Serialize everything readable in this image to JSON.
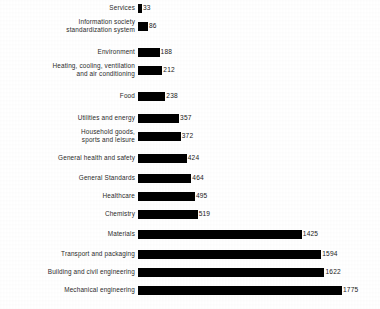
{
  "chart_data": {
    "type": "bar",
    "orientation": "horizontal",
    "title": "",
    "subtitle": "",
    "xlabel": "",
    "ylabel": "",
    "grid": false,
    "legend": null,
    "axis_visible": false,
    "value_labels": true,
    "xlim": [
      0,
      1775
    ],
    "bar_color": "#000000",
    "background_color": "#ffffff",
    "categories": [
      "Services",
      "Information society\nstandardization system",
      "Environment",
      "Heating, cooling, ventilation\nand air conditioning",
      "Food",
      "Utilities and energy",
      "Household goods,\nsports and leisure",
      "General health and safety",
      "General Standards",
      "Healthcare",
      "Chemistry",
      "Materials",
      "Transport and packaging",
      "Building and civil engineering",
      "Mechanical engineering"
    ],
    "values": [
      33,
      86,
      188,
      212,
      238,
      357,
      372,
      424,
      464,
      495,
      519,
      1425,
      1594,
      1622,
      1775
    ],
    "value_labels_text": [
      "33",
      "86",
      "188",
      "212",
      "238",
      "357",
      "372",
      "424",
      "464",
      "495",
      "519",
      "1425",
      "1594",
      "1622",
      "1775"
    ]
  },
  "rows": [
    {
      "label": "Services",
      "value": 33,
      "value_text": "33"
    },
    {
      "label": "Information society\nstandardization system",
      "value": 86,
      "value_text": "86"
    },
    {
      "label": "Environment",
      "value": 188,
      "value_text": "188"
    },
    {
      "label": "Heating, cooling, ventilation\nand air conditioning",
      "value": 212,
      "value_text": "212"
    },
    {
      "label": "Food",
      "value": 238,
      "value_text": "238"
    },
    {
      "label": "Utilities and energy",
      "value": 357,
      "value_text": "357"
    },
    {
      "label": "Household goods,\nsports and leisure",
      "value": 372,
      "value_text": "372"
    },
    {
      "label": "General health and safety",
      "value": 424,
      "value_text": "424"
    },
    {
      "label": "General Standards",
      "value": 464,
      "value_text": "464"
    },
    {
      "label": "Healthcare",
      "value": 495,
      "value_text": "495"
    },
    {
      "label": "Chemistry",
      "value": 519,
      "value_text": "519"
    },
    {
      "label": "Materials",
      "value": 1425,
      "value_text": "1425"
    },
    {
      "label": "Transport and packaging",
      "value": 1594,
      "value_text": "1594"
    },
    {
      "label": "Building and civil engineering",
      "value": 1622,
      "value_text": "1622"
    },
    {
      "label": "Mechanical engineering",
      "value": 1775,
      "value_text": "1775"
    }
  ]
}
